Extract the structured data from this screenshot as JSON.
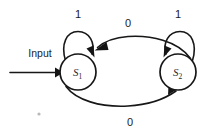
{
  "figure": {
    "kind": "state-transition-diagram",
    "background_color": "#ffffff",
    "ink_color": "#171717",
    "width": 215,
    "height": 132
  },
  "input_arrow": {
    "label": "Input",
    "target_state": "S1",
    "direction": "left-to-right"
  },
  "states": [
    {
      "id": "S1",
      "label_main": "S",
      "label_sub": "1",
      "cx": 78,
      "cy": 72,
      "r": 18
    },
    {
      "id": "S2",
      "label_main": "S",
      "label_sub": "2",
      "cx": 178,
      "cy": 72,
      "r": 18
    }
  ],
  "transitions": [
    {
      "id": "s1-self-loop",
      "from": "S1",
      "to": "S1",
      "label": "1",
      "label_x": 78,
      "label_y": 18,
      "position": "above-s1"
    },
    {
      "id": "s2-self-loop",
      "from": "S2",
      "to": "S2",
      "label": "1",
      "label_x": 178,
      "label_y": 18,
      "position": "above-s2"
    },
    {
      "id": "s2-to-s1",
      "from": "S2",
      "to": "S1",
      "label": "0",
      "label_x": 128,
      "label_y": 27,
      "position": "top-curve"
    },
    {
      "id": "s1-to-s2",
      "from": "S1",
      "to": "S2",
      "label": "0",
      "label_x": 130,
      "label_y": 126,
      "position": "bottom-curve"
    }
  ],
  "artifacts": [
    {
      "id": "scan-speck",
      "x": 39,
      "y": 114,
      "r": 1.6,
      "color": "#b9b9b9"
    }
  ]
}
